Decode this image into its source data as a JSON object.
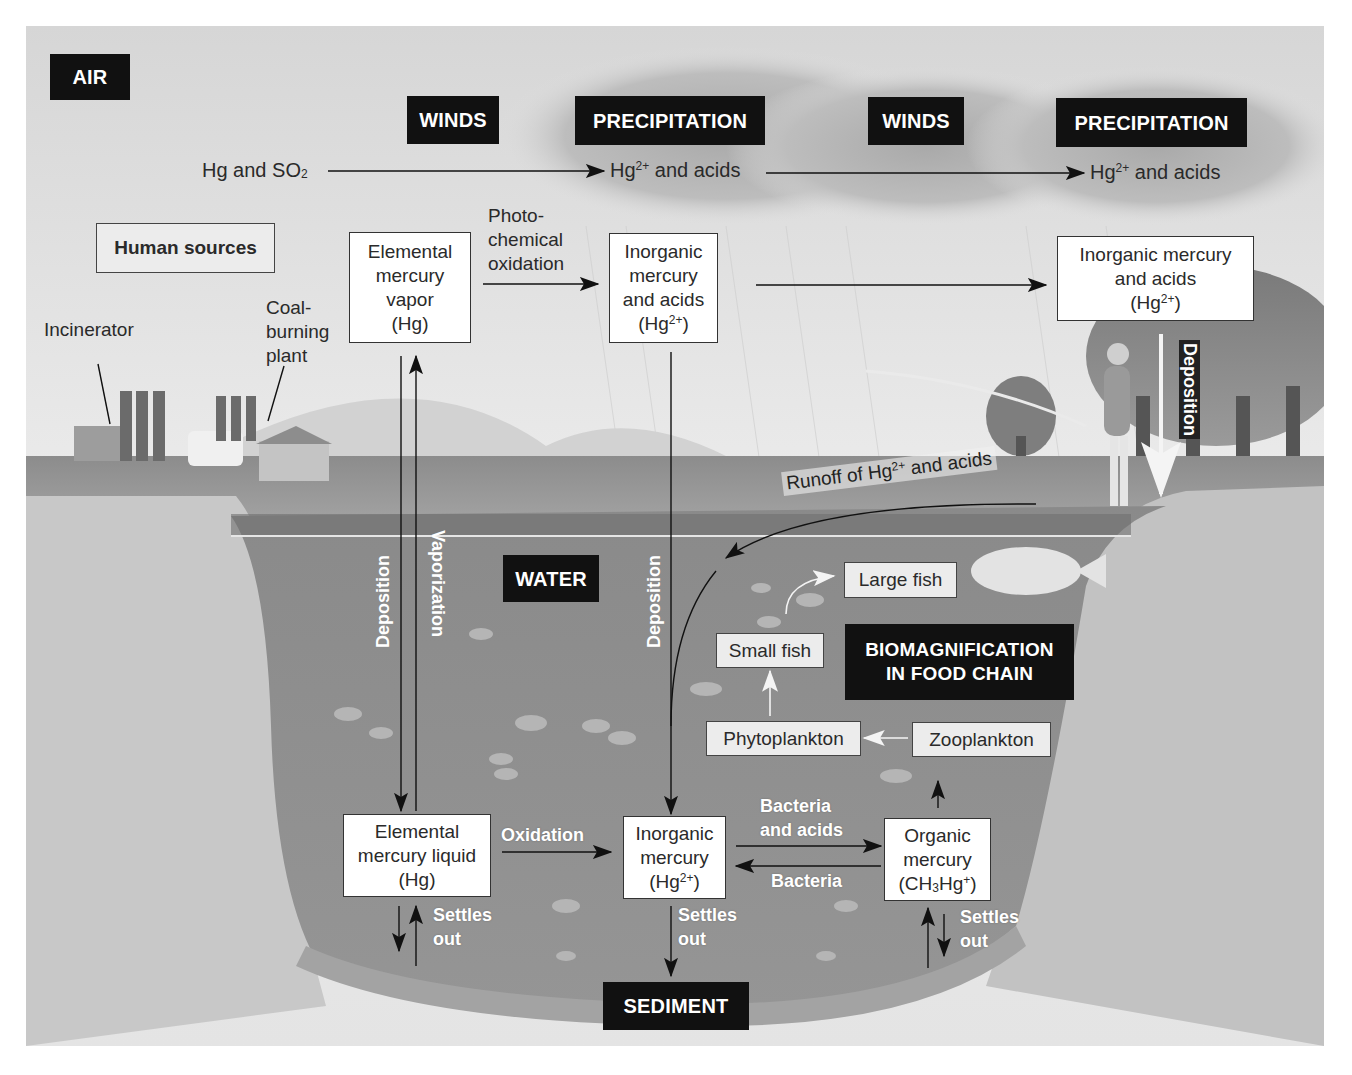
{
  "diagram": {
    "zones": {
      "air": "AIR",
      "water": "WATER",
      "sediment": "SEDIMENT"
    },
    "headers": {
      "winds_1": "WINDS",
      "precipitation_1": "PRECIPITATION",
      "winds_2": "WINDS",
      "precipitation_2": "PRECIPITATION",
      "biomagnification": [
        "BIOMAGNIFICATION",
        "IN FOOD CHAIN"
      ]
    },
    "atmosphere_flow": {
      "start": "Hg and SO",
      "start_sub": "2",
      "mid_prefix": "Hg",
      "mid_sup": "2+",
      "mid_suffix": " and acids",
      "end_prefix": "Hg",
      "end_sup": "2+",
      "end_suffix": " and acids"
    },
    "sources": {
      "box": "Human sources",
      "incinerator": "Incinerator",
      "coal_plant": [
        "Coal-",
        "burning",
        "plant"
      ]
    },
    "air_boxes": {
      "elemental_vapor": [
        "Elemental",
        "mercury",
        "vapor",
        "(Hg)"
      ],
      "photo_oxidation": [
        "Photo-",
        "chemical",
        "oxidation"
      ],
      "inorganic_1": [
        "Inorganic",
        "mercury",
        "and acids"
      ],
      "inorganic_1_formula": {
        "prefix": "(Hg",
        "sup": "2+",
        "suffix": ")"
      },
      "inorganic_2": [
        "Inorganic mercury",
        "and acids"
      ],
      "inorganic_2_formula": {
        "prefix": "(Hg",
        "sup": "2+",
        "suffix": ")"
      }
    },
    "process_labels": {
      "deposition_left": "Deposition",
      "vaporization": "Vaporization",
      "deposition_center": "Deposition",
      "deposition_right": "Deposition",
      "runoff_prefix": "Runoff of Hg",
      "runoff_sup": "2+",
      "runoff_suffix": " and acids",
      "oxidation": "Oxidation",
      "bacteria_acids": [
        "Bacteria",
        "and acids"
      ],
      "bacteria": "Bacteria",
      "settles_out": [
        "Settles",
        "out"
      ]
    },
    "food_chain": {
      "large_fish": "Large fish",
      "small_fish": "Small fish",
      "phytoplankton": "Phytoplankton",
      "zooplankton": "Zooplankton"
    },
    "water_boxes": {
      "elemental_liquid": [
        "Elemental",
        "mercury liquid",
        "(Hg)"
      ],
      "inorganic": [
        "Inorganic",
        "mercury"
      ],
      "inorganic_formula": {
        "prefix": "(Hg",
        "sup": "2+",
        "suffix": ")"
      },
      "organic": [
        "Organic",
        "mercury"
      ],
      "organic_formula": {
        "a": "(CH",
        "sub": "3",
        "b": "Hg",
        "sup": "+",
        "c": ")"
      }
    },
    "colors": {
      "label_box": "#111111",
      "water": "#8a8a8a",
      "ground": "#b5b5b5",
      "sky": "#e2e2e2"
    }
  }
}
